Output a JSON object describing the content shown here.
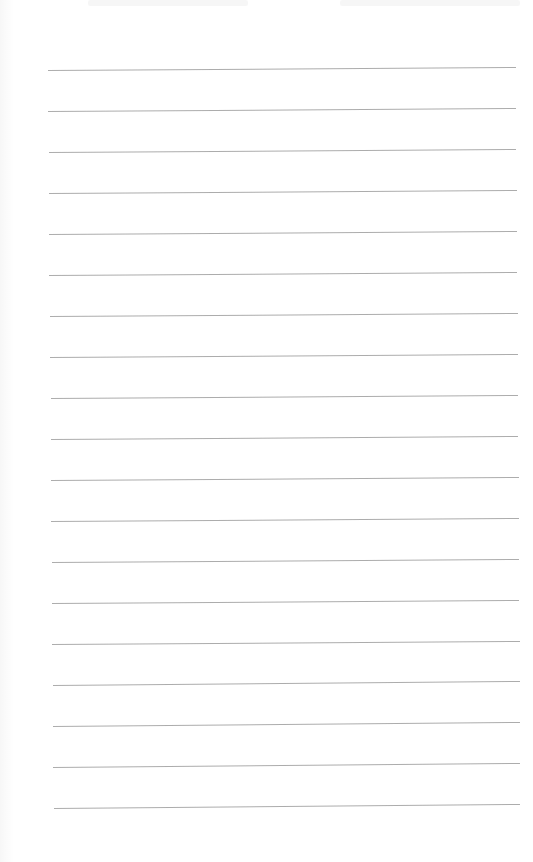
{
  "document": {
    "type": "ruled-notebook-page",
    "background_color": "#ffffff",
    "line_color": "#a3a3a3",
    "line_count": 19,
    "line_spacing_px": 41,
    "handwritten_text": ""
  },
  "lines": [
    {
      "x1": 48,
      "y1": 70,
      "x2": 516,
      "y2": 67
    },
    {
      "x1": 48,
      "y1": 111,
      "x2": 516,
      "y2": 108
    },
    {
      "x1": 49,
      "y1": 152,
      "x2": 516,
      "y2": 149
    },
    {
      "x1": 49,
      "y1": 193,
      "x2": 517,
      "y2": 190
    },
    {
      "x1": 49,
      "y1": 234,
      "x2": 517,
      "y2": 231
    },
    {
      "x1": 49,
      "y1": 275,
      "x2": 517,
      "y2": 272
    },
    {
      "x1": 50,
      "y1": 316,
      "x2": 518,
      "y2": 313
    },
    {
      "x1": 50,
      "y1": 357,
      "x2": 518,
      "y2": 354
    },
    {
      "x1": 51,
      "y1": 398,
      "x2": 518,
      "y2": 395
    },
    {
      "x1": 51,
      "y1": 439,
      "x2": 518,
      "y2": 436
    },
    {
      "x1": 51,
      "y1": 480,
      "x2": 519,
      "y2": 477
    },
    {
      "x1": 51,
      "y1": 521,
      "x2": 519,
      "y2": 518
    },
    {
      "x1": 52,
      "y1": 562,
      "x2": 519,
      "y2": 559
    },
    {
      "x1": 52,
      "y1": 603,
      "x2": 519,
      "y2": 600
    },
    {
      "x1": 52,
      "y1": 644,
      "x2": 520,
      "y2": 641
    },
    {
      "x1": 53,
      "y1": 685,
      "x2": 520,
      "y2": 681
    },
    {
      "x1": 53,
      "y1": 726,
      "x2": 520,
      "y2": 722
    },
    {
      "x1": 53,
      "y1": 767,
      "x2": 520,
      "y2": 763
    },
    {
      "x1": 54,
      "y1": 808,
      "x2": 520,
      "y2": 804
    }
  ]
}
